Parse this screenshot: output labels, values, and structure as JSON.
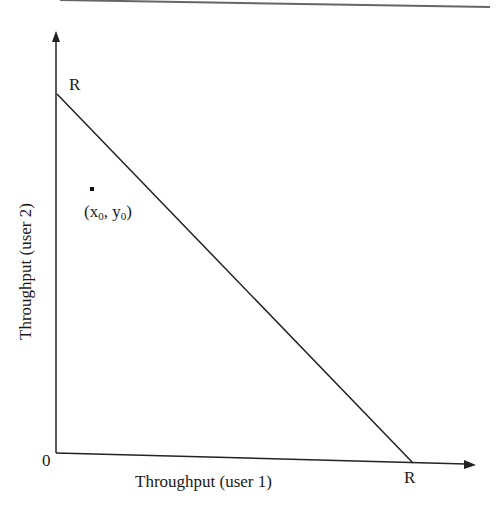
{
  "diagram": {
    "type": "throughput-region",
    "x_axis": {
      "label": "Throughput (user 1)",
      "origin_label": "0",
      "intercept_label": "R"
    },
    "y_axis": {
      "label": "Throughput (user 2)",
      "intercept_label": "R"
    },
    "boundary_line": {
      "from": "R on y-axis",
      "to": "R on x-axis"
    },
    "point": {
      "x_label": "x",
      "x_sub": "0",
      "y_label": "y",
      "y_sub": "0"
    },
    "colors": {
      "ink": "#1a1a1a",
      "rule": "#555555",
      "background": "#ffffff"
    }
  }
}
